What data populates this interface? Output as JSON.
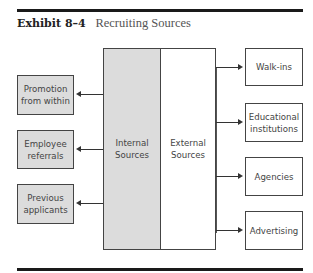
{
  "exhibit": {
    "number": "Exhibit 8–4",
    "title": "Recruiting Sources"
  },
  "center": {
    "internal": "Internal Sources",
    "external": "External Sources",
    "internal_color": "#dcdcdc",
    "external_color": "#ffffff"
  },
  "internal_sources": [
    {
      "line1": "Promotion",
      "line2": "from within"
    },
    {
      "line1": "Employee",
      "line2": "referrals"
    },
    {
      "line1": "Previous",
      "line2": "applicants"
    }
  ],
  "external_sources": [
    {
      "line1": "Walk-ins",
      "line2": ""
    },
    {
      "line1": "Educational",
      "line2": "institutions"
    },
    {
      "line1": "Agencies",
      "line2": ""
    },
    {
      "line1": "Advertising",
      "line2": ""
    }
  ]
}
